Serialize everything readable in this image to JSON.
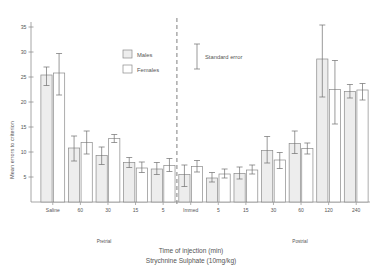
{
  "figure": {
    "caption_line1": "Time of injection (min)",
    "caption_line2": "Strychnine Sulphate (10mg/kg)",
    "ylabel": "Mean errors to criterion",
    "section_left": "Pretrial",
    "section_right": "Postrial",
    "divider": "dashed-vertical-divider"
  },
  "legend": {
    "males_label": "Males",
    "females_label": "Females",
    "error_label": "Standard error",
    "males_fill": "#ededed",
    "females_fill": "#ffffff",
    "stroke": "#8a8a8a"
  },
  "yaxis": {
    "ticks": [
      5,
      10,
      15,
      20,
      25,
      30,
      35
    ],
    "tick_labels": [
      "5",
      "10",
      "15",
      "20",
      "25",
      "30",
      "35"
    ],
    "min": 0,
    "max": 36
  },
  "chart_data": {
    "type": "bar",
    "title": "",
    "xlabel": "Time of injection (min)",
    "ylabel": "Mean errors to criterion",
    "ylim": [
      0,
      36
    ],
    "grid": false,
    "legend_position": "inside-top-center",
    "categories": [
      "Saline",
      "60",
      "30",
      "15",
      "5",
      "Immed",
      "5",
      "15",
      "30",
      "60",
      "120",
      "240"
    ],
    "sections": [
      "Pretrial",
      "Pretrial",
      "Pretrial",
      "Pretrial",
      "Pretrial",
      "Postrial",
      "Postrial",
      "Postrial",
      "Postrial",
      "Postrial",
      "Postrial",
      "Postrial"
    ],
    "series": [
      {
        "name": "Males",
        "values": [
          25.4,
          10.8,
          9.3,
          7.9,
          6.6,
          5.5,
          4.8,
          5.7,
          10.3,
          11.7,
          28.6,
          22.1
        ],
        "errors_upper": [
          27.0,
          13.2,
          11.0,
          8.9,
          7.9,
          7.4,
          5.9,
          7.0,
          13.1,
          14.2,
          35.4,
          23.5
        ],
        "errors_lower": [
          23.3,
          8.2,
          7.5,
          6.9,
          5.5,
          3.1,
          4.0,
          4.6,
          7.8,
          9.7,
          21.0,
          20.8
        ]
      },
      {
        "name": "Females",
        "values": [
          25.8,
          11.9,
          12.7,
          6.8,
          7.3,
          7.1,
          5.6,
          6.4,
          8.4,
          10.7,
          22.5,
          22.4
        ],
        "errors_upper": [
          29.7,
          14.2,
          13.5,
          8.0,
          8.7,
          8.3,
          6.6,
          7.4,
          9.9,
          11.8,
          28.3,
          23.7
        ],
        "errors_lower": [
          21.4,
          9.6,
          11.9,
          5.9,
          6.1,
          6.0,
          4.8,
          5.6,
          6.7,
          9.6,
          15.6,
          20.4
        ]
      }
    ],
    "standard_error_marker": {
      "center": 29.0,
      "upper": 31.6,
      "lower": 26.6
    }
  }
}
